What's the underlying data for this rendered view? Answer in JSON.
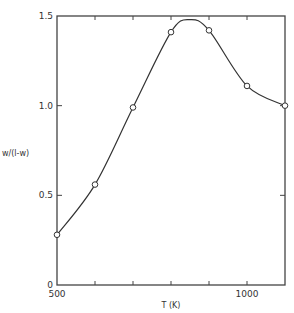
{
  "chart_data": {
    "type": "line",
    "title": "",
    "xlabel": "T (K)",
    "ylabel": "w/(l-w)",
    "xlim": [
      500,
      1100
    ],
    "ylim": [
      0,
      1.5
    ],
    "x_ticks": [
      500,
      600,
      700,
      800,
      900,
      1000,
      1100
    ],
    "x_tick_labels": [
      "500",
      "",
      "",
      "",
      "",
      "1000",
      ""
    ],
    "y_ticks": [
      0,
      0.5,
      1.0,
      1.5
    ],
    "y_tick_labels": [
      "0",
      "0.5",
      "1.0",
      "1.5"
    ],
    "grid": false,
    "legend": null,
    "series": [
      {
        "name": "measured",
        "marker": "open-circle",
        "x": [
          500,
          600,
          700,
          800,
          900,
          1000,
          1100
        ],
        "y": [
          0.28,
          0.56,
          0.99,
          1.41,
          1.42,
          1.11,
          1.0
        ]
      }
    ],
    "curve": {
      "description": "smooth fitted curve through points, peak near 850 K",
      "peak": {
        "x": 850,
        "y": 1.48
      }
    }
  },
  "colors": {
    "line": "#333333",
    "axis": "#444444",
    "background": "#ffffff"
  }
}
